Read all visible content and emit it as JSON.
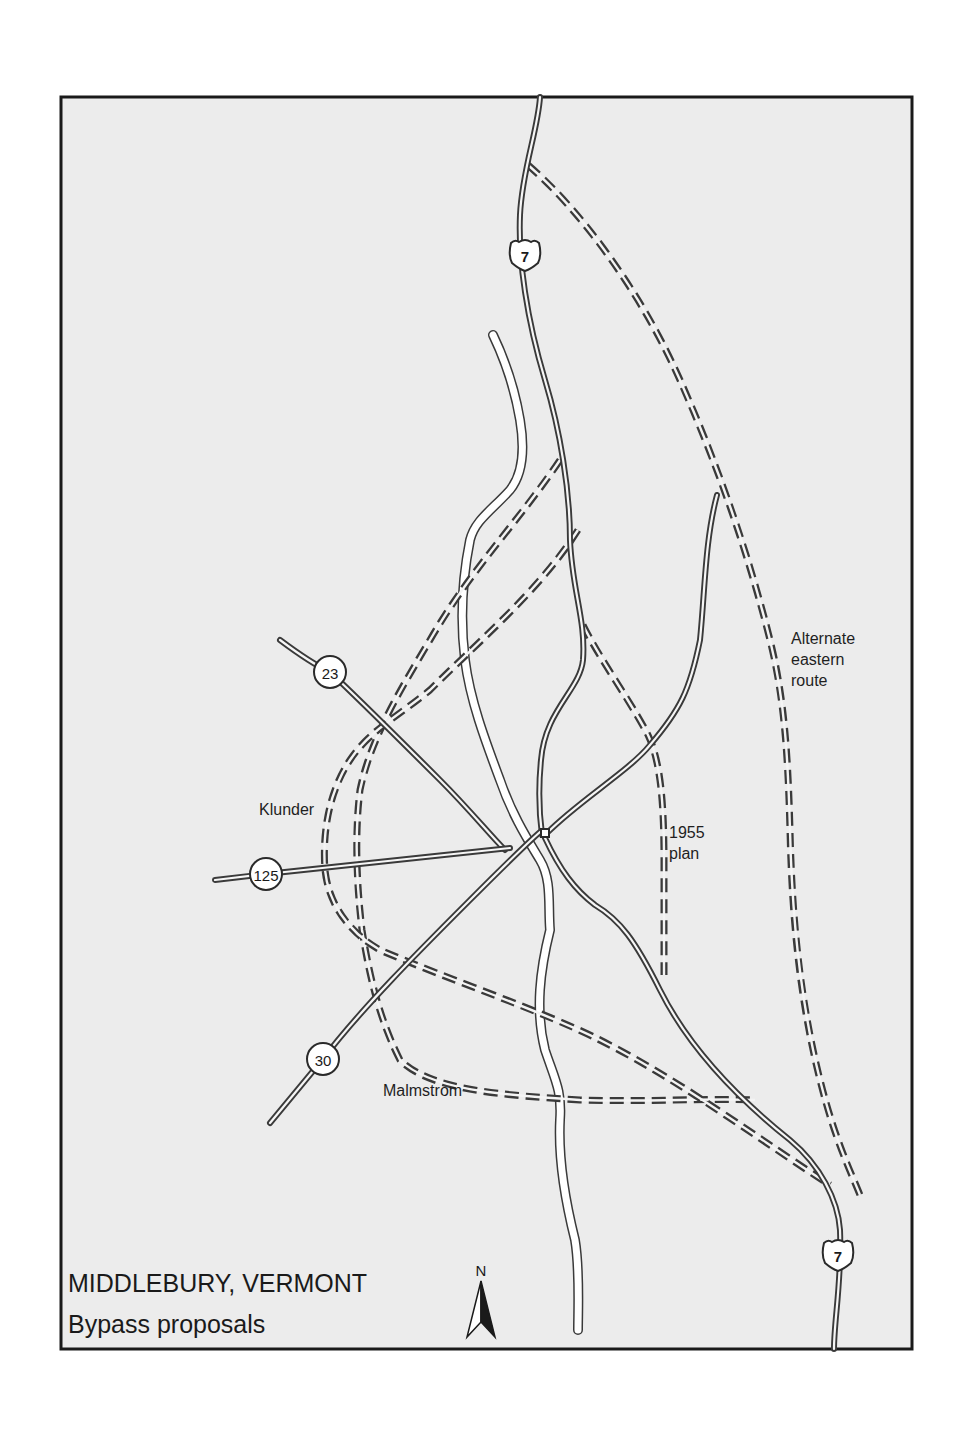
{
  "map": {
    "title": "MIDDLEBURY, VERMONT",
    "subtitle": "Bypass proposals",
    "north_label": "N",
    "frame": {
      "x": 61,
      "y": 97,
      "w": 851,
      "h": 1252
    },
    "colors": {
      "background": "#ececec",
      "border": "#1a1a1a",
      "road_casing": "#3a3a3a",
      "road_fill": "#f6f6f6",
      "river": "#ffffff"
    }
  },
  "route_shields": [
    {
      "id": "us-7-north",
      "type": "us-highway",
      "label": "7",
      "x": 525,
      "y": 255
    },
    {
      "id": "us-7-south",
      "type": "us-highway",
      "label": "7",
      "x": 838,
      "y": 1255
    },
    {
      "id": "vt-23",
      "type": "state-route",
      "label": "23",
      "x": 330,
      "y": 672
    },
    {
      "id": "vt-125",
      "type": "state-route",
      "label": "125",
      "x": 266,
      "y": 874
    },
    {
      "id": "vt-30",
      "type": "state-route",
      "label": "30",
      "x": 323,
      "y": 1059
    }
  ],
  "proposal_labels": [
    {
      "id": "klunder",
      "lines": [
        "Klunder"
      ],
      "x": 259,
      "y": 815
    },
    {
      "id": "plan-1955",
      "lines": [
        "1955",
        "plan"
      ],
      "x": 669,
      "y": 838
    },
    {
      "id": "alternate-eastern",
      "lines": [
        "Alternate",
        "eastern",
        "route"
      ],
      "x": 791,
      "y": 644
    },
    {
      "id": "malmstrom",
      "lines": [
        "Malmstrom"
      ],
      "x": 383,
      "y": 1096
    }
  ],
  "roads": [
    {
      "id": "us-7-north-segment",
      "d": "M 540 97 C 538 130, 522 170, 520 215 C 518 260, 527 320, 545 380 C 560 430, 570 490, 570 540 C 572 590, 586 620, 583 660 C 580 690, 545 710, 541 760 C 538 790, 540 820, 542 835"
    },
    {
      "id": "us-7-south-segment",
      "d": "M 545 838 C 560 870, 575 890, 595 905 C 620 920, 635 940, 660 990 C 690 1050, 740 1100, 790 1140 C 820 1165, 838 1200, 840 1230 C 842 1280, 834 1320, 834 1349"
    },
    {
      "id": "vt-23-segment",
      "d": "M 280 640 C 300 655, 315 665, 330 672 C 360 700, 400 740, 440 780 C 470 810, 490 835, 505 850"
    },
    {
      "id": "vt-125-segment",
      "d": "M 215 880 L 266 874 L 510 848"
    },
    {
      "id": "vt-30-segment",
      "d": "M 270 1123 L 323 1059 C 360 1010, 420 950, 470 900 C 500 870, 525 845, 540 832"
    },
    {
      "id": "east-road-segment",
      "d": "M 548 832 C 580 800, 630 770, 650 745 C 680 710, 690 690, 700 640 C 705 590, 705 540, 717 495"
    }
  ],
  "river": {
    "id": "otter-creek",
    "segments": [
      {
        "d": "M 493 335 C 505 360, 515 390, 520 420 C 525 450, 522 475, 510 490 C 492 510, 475 520, 470 540 C 462 580, 460 620, 465 660 C 470 700, 485 740, 500 780 C 512 815, 528 840, 540 860 C 552 880, 548 905, 550 930 C 540 970, 535 1010, 545 1050 C 555 1080, 562 1090, 560 1120 C 558 1160, 565 1200, 575 1240 C 580 1270, 578 1310, 578 1330",
        "w": 7
      }
    ]
  },
  "proposals": [
    {
      "id": "alternate-eastern-route",
      "d": "M 528 165 C 580 210, 640 290, 680 380 C 720 470, 750 560, 770 640 C 785 700, 788 760, 790 830 C 792 920, 800 1000, 820 1080 C 835 1140, 850 1170, 860 1195"
    },
    {
      "id": "plan-1955-route",
      "d": "M 583 625 C 600 660, 630 700, 648 735 C 660 760, 664 800, 664 860 L 664 975"
    },
    {
      "id": "klunder-route-a",
      "d": "M 560 460 C 520 520, 470 570, 430 640 C 400 690, 370 740, 360 790 C 355 830, 356 880, 362 930 C 370 980, 380 1020, 400 1060 C 430 1090, 500 1095, 580 1100 C 650 1102, 710 1098, 755 1100"
    },
    {
      "id": "klunder-route-b",
      "d": "M 578 530 C 540 590, 480 640, 430 690 C 400 715, 370 730, 350 760 C 330 790, 322 830, 325 870 C 328 900, 345 930, 380 950 C 450 980, 540 1010, 600 1040 C 680 1080, 760 1140, 830 1185"
    }
  ],
  "junction_marker": {
    "x": 545,
    "y": 833
  }
}
